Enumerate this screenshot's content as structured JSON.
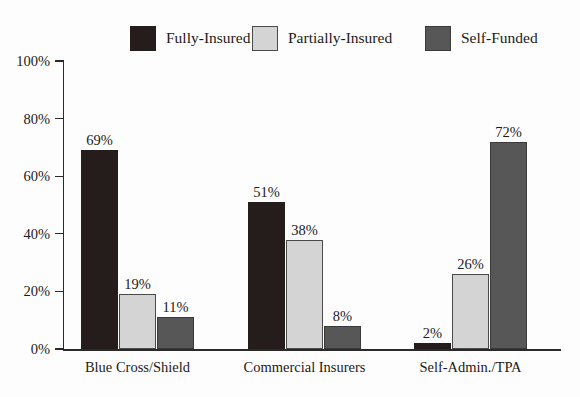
{
  "chart_data": {
    "type": "bar",
    "title": "",
    "subtitle": "",
    "xlabel": "",
    "ylabel": "",
    "ylim": [
      0,
      100
    ],
    "ytick_labels": [
      "0%",
      "20%",
      "40%",
      "60%",
      "80%",
      "100%"
    ],
    "ytick_values": [
      0,
      20,
      40,
      60,
      80,
      100
    ],
    "grid": false,
    "legend_position": "top",
    "value_label_suffix": "%",
    "categories": [
      "Blue Cross/Shield",
      "Commercial Insurers",
      "Self-Admin./TPA"
    ],
    "series": [
      {
        "name": "Fully-Insured",
        "color": "#241d1b",
        "border": "#241d1b",
        "values": [
          69,
          51,
          2
        ],
        "labels": [
          "69%",
          "51%",
          "2%"
        ]
      },
      {
        "name": "Partially-Insured",
        "color": "#d4d4d4",
        "border": "#4a4a4a",
        "values": [
          19,
          38,
          26
        ],
        "labels": [
          "19%",
          "38%",
          "26%"
        ]
      },
      {
        "name": "Self-Funded",
        "color": "#575757",
        "border": "#3a3a3a",
        "values": [
          11,
          8,
          72
        ],
        "labels": [
          "11%",
          "8%",
          "72%"
        ]
      }
    ]
  },
  "legend": {
    "items": [
      {
        "label": "Fully-Insured",
        "color": "#241d1b",
        "border": "#241d1b"
      },
      {
        "label": "Partially-Insured",
        "color": "#d4d4d4",
        "border": "#4a4a4a"
      },
      {
        "label": "Self-Funded",
        "color": "#575757",
        "border": "#3a3a3a"
      }
    ]
  },
  "axes": {
    "y_ticks": [
      {
        "label": "100%",
        "value": 100
      },
      {
        "label": "80%",
        "value": 80
      },
      {
        "label": "60%",
        "value": 60
      },
      {
        "label": "40%",
        "value": 40
      },
      {
        "label": "20%",
        "value": 20
      },
      {
        "label": "0%",
        "value": 0
      }
    ],
    "x_categories": [
      {
        "label": "Blue Cross/Shield"
      },
      {
        "label": "Commercial Insurers"
      },
      {
        "label": "Self-Admin./TPA"
      }
    ]
  },
  "colors": {
    "background": "#fdfdfd",
    "axis": "#2a2a2a",
    "text": "#1e1a18"
  }
}
